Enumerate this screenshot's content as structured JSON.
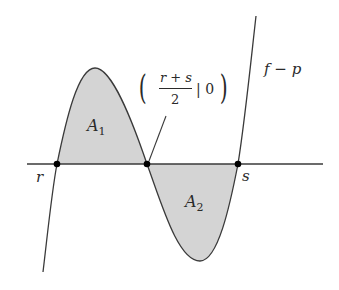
{
  "diagram": {
    "curve_label": "f − p",
    "areas": [
      {
        "label": "A",
        "subscript": "1"
      },
      {
        "label": "A",
        "subscript": "2"
      }
    ],
    "points": {
      "left_root": "r",
      "right_root": "s"
    },
    "midpoint_annotation": {
      "numerator": "r + s",
      "denominator": "2",
      "separator_and_value": "| 0"
    },
    "colors": {
      "fill": "#d4d4d4",
      "stroke": "#3a3a3a",
      "point": "#000000"
    }
  }
}
